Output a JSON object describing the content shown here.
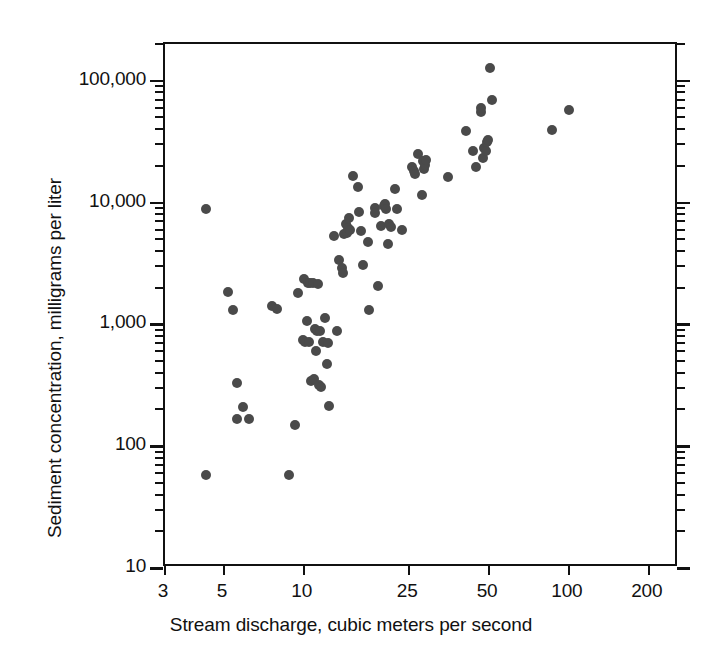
{
  "figure": {
    "background_color": "#ffffff",
    "frame_color": "#111111",
    "marker_color": "#4a4a4a"
  },
  "chart_data": {
    "type": "scatter",
    "title": "",
    "xlabel": "Stream discharge, cubic meters per second",
    "ylabel": "Sediment concentration, milligrams per liter",
    "xscale": "log",
    "yscale": "log",
    "xlim": [
      3,
      260
    ],
    "ylim": [
      10,
      200000
    ],
    "grid": false,
    "legend": null,
    "xticks": [
      3,
      5,
      10,
      25,
      50,
      100,
      200
    ],
    "xtick_labels": [
      "3",
      "5",
      "10",
      "25",
      "50",
      "100",
      "200"
    ],
    "yticks": [
      10,
      100,
      1000,
      10000,
      100000
    ],
    "ytick_labels": [
      "10",
      "100",
      "1,000",
      "10,000",
      "100,000"
    ],
    "marker": "circle",
    "marker_size_px": 10,
    "n_points": 97,
    "points": [
      [
        4.3,
        8800
      ],
      [
        4.3,
        58
      ],
      [
        5.2,
        1850
      ],
      [
        5.4,
        1320
      ],
      [
        5.6,
        330
      ],
      [
        5.6,
        168
      ],
      [
        5.9,
        210
      ],
      [
        6.2,
        168
      ],
      [
        7.6,
        1420
      ],
      [
        7.9,
        1330
      ],
      [
        8.8,
        58
      ],
      [
        9.3,
        150
      ],
      [
        9.5,
        1800
      ],
      [
        9.9,
        740
      ],
      [
        10.1,
        720
      ],
      [
        10.0,
        2350
      ],
      [
        10.3,
        1070
      ],
      [
        10.4,
        2180
      ],
      [
        10.5,
        720
      ],
      [
        10.6,
        2200
      ],
      [
        10.7,
        345
      ],
      [
        10.8,
        2200
      ],
      [
        10.9,
        355
      ],
      [
        11.0,
        910
      ],
      [
        11.1,
        600
      ],
      [
        11.2,
        875
      ],
      [
        11.3,
        2150
      ],
      [
        11.4,
        320
      ],
      [
        11.5,
        880
      ],
      [
        11.6,
        305
      ],
      [
        11.8,
        720
      ],
      [
        12.0,
        1120
      ],
      [
        12.2,
        470
      ],
      [
        12.4,
        700
      ],
      [
        12.5,
        215
      ],
      [
        13.3,
        890
      ],
      [
        13.0,
        5300
      ],
      [
        13.6,
        3400
      ],
      [
        14.0,
        2900
      ],
      [
        14.1,
        2650
      ],
      [
        14.2,
        5500
      ],
      [
        14.5,
        6600
      ],
      [
        14.6,
        5600
      ],
      [
        14.7,
        6200
      ],
      [
        14.8,
        7400
      ],
      [
        15.0,
        5900
      ],
      [
        15.3,
        16500
      ],
      [
        16.0,
        13500
      ],
      [
        16.2,
        8400
      ],
      [
        16.5,
        5800
      ],
      [
        16.8,
        3050
      ],
      [
        17.5,
        4700
      ],
      [
        17.6,
        1300
      ],
      [
        18.5,
        9000
      ],
      [
        18.6,
        8200
      ],
      [
        19.0,
        2050
      ],
      [
        19.5,
        6400
      ],
      [
        20.0,
        9400
      ],
      [
        20.2,
        9700
      ],
      [
        20.4,
        8800
      ],
      [
        20.7,
        4600
      ],
      [
        21.0,
        6700
      ],
      [
        21.3,
        6300
      ],
      [
        22.0,
        12800
      ],
      [
        22.5,
        8800
      ],
      [
        23.5,
        5900
      ],
      [
        25.5,
        19500
      ],
      [
        26.0,
        18200
      ],
      [
        26.2,
        17000
      ],
      [
        27.0,
        25000
      ],
      [
        28.0,
        11600
      ],
      [
        28.2,
        22000
      ],
      [
        28.4,
        19000
      ],
      [
        28.6,
        20500
      ],
      [
        29.0,
        22500
      ],
      [
        35.0,
        16200
      ],
      [
        41.0,
        39000
      ],
      [
        43.5,
        26500
      ],
      [
        44.5,
        19500
      ],
      [
        46.5,
        55000
      ],
      [
        46.8,
        60000
      ],
      [
        47.5,
        23000
      ],
      [
        48.0,
        28000
      ],
      [
        48.5,
        26500
      ],
      [
        49.0,
        31500
      ],
      [
        49.5,
        32500
      ],
      [
        50.5,
        128000
      ],
      [
        51.5,
        70000
      ],
      [
        86.0,
        39500
      ],
      [
        100.0,
        58000
      ]
    ]
  }
}
